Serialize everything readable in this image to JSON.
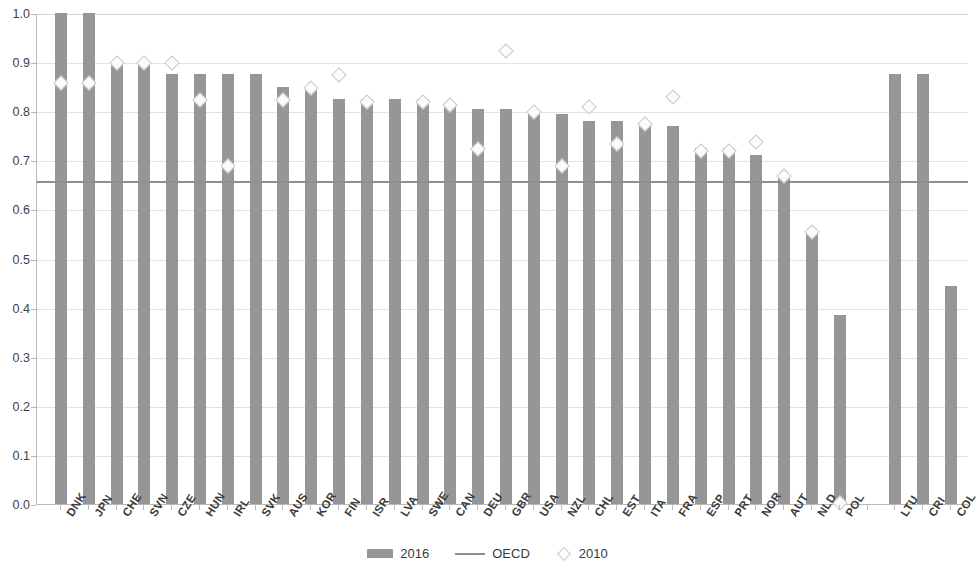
{
  "chart_data": {
    "type": "bar",
    "title": "",
    "subtitle": "",
    "xlabel": "",
    "ylabel": "",
    "ylim": [
      0.0,
      1.0
    ],
    "ytick_labels": [
      "1.0",
      "0.9",
      "0.8",
      "0.7",
      "0.6",
      "0.5",
      "0.4",
      "0.3",
      "0.2",
      "0.1",
      "0.0"
    ],
    "ytick_values": [
      1.0,
      0.9,
      0.8,
      0.7,
      0.6,
      0.5,
      0.4,
      0.3,
      0.2,
      0.1,
      0.0
    ],
    "grid": true,
    "legend_position": "bottom",
    "categories": [
      "DNK",
      "JPN",
      "CHE",
      "SVN",
      "CZE",
      "HUN",
      "IRL",
      "SVK",
      "AUS",
      "KOR",
      "FIN",
      "ISR",
      "LVA",
      "SWE",
      "CAN",
      "DEU",
      "GBR",
      "USA",
      "NZL",
      "CHL",
      "EST",
      "ITA",
      "FRA",
      "ESP",
      "PRT",
      "NOR",
      "AUT",
      "NLD",
      "POL",
      "",
      "LTU",
      "CRI",
      "COL"
    ],
    "series": [
      {
        "name": "2016",
        "type": "bar",
        "color": "#969696",
        "values": [
          1.0,
          1.0,
          0.9,
          0.9,
          0.875,
          0.875,
          0.875,
          0.875,
          0.85,
          0.85,
          0.825,
          0.825,
          0.825,
          0.825,
          0.815,
          0.805,
          0.805,
          0.8,
          0.795,
          0.78,
          0.78,
          0.775,
          0.77,
          0.725,
          0.725,
          0.71,
          0.67,
          0.555,
          0.385,
          null,
          0.875,
          0.875,
          0.445
        ]
      },
      {
        "name": "2010",
        "type": "scatter",
        "marker": "diamond",
        "color": "#fbfbfb",
        "values": [
          0.86,
          0.86,
          0.9,
          0.9,
          0.9,
          0.825,
          0.69,
          null,
          0.825,
          0.85,
          0.875,
          0.82,
          null,
          0.82,
          0.815,
          0.725,
          0.925,
          0.8,
          0.69,
          0.81,
          0.735,
          0.775,
          0.83,
          0.72,
          0.72,
          0.74,
          0.67,
          0.555,
          0.005,
          null,
          null,
          null,
          null
        ]
      }
    ],
    "reference_line": {
      "name": "OECD",
      "value": 0.66,
      "color": "#8f8f8f"
    },
    "legend": [
      {
        "label": "2016",
        "marker": "bar-swatch"
      },
      {
        "label": "OECD",
        "marker": "line-swatch"
      },
      {
        "label": "2010",
        "marker": "diamond-swatch"
      }
    ]
  }
}
